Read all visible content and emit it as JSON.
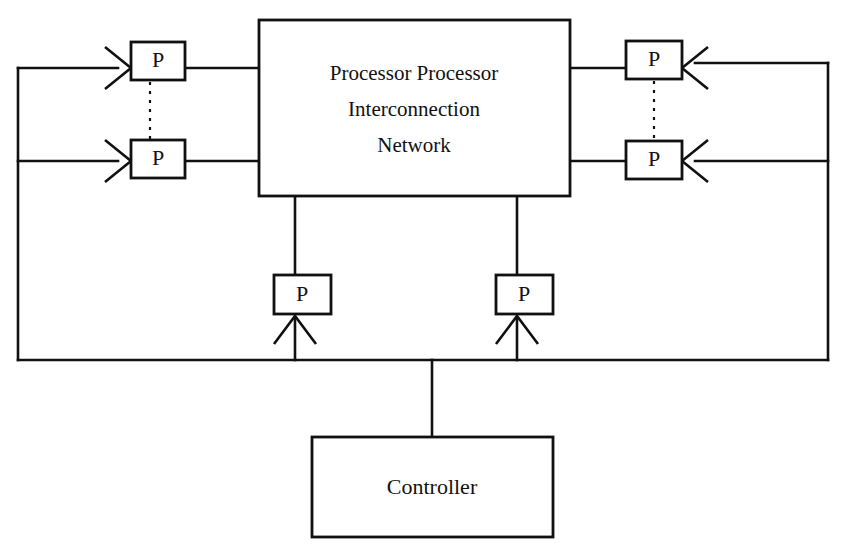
{
  "diagram": {
    "background_color": "#ffffff",
    "line_color": "#111111",
    "main_block": {
      "label_line1": "Processor Processor",
      "label_line2": "Interconnection",
      "label_line3": "Network"
    },
    "controller_block": {
      "label": "Controller"
    },
    "processors": [
      {
        "id": "p-left-top",
        "label": "P",
        "side": "left",
        "arrow": "right"
      },
      {
        "id": "p-left-bottom",
        "label": "P",
        "side": "left",
        "arrow": "right"
      },
      {
        "id": "p-right-top",
        "label": "P",
        "side": "right",
        "arrow": "left"
      },
      {
        "id": "p-right-bottom",
        "label": "P",
        "side": "right",
        "arrow": "left"
      },
      {
        "id": "p-bottom-left",
        "label": "P",
        "side": "bottom",
        "arrow": "up"
      },
      {
        "id": "p-bottom-right",
        "label": "P",
        "side": "bottom",
        "arrow": "up"
      }
    ],
    "connectors": {
      "vertical_dotted_left": "dotted",
      "vertical_dotted_right": "dotted",
      "left_bus": "solid",
      "right_bus": "solid",
      "bottom_bus": "solid",
      "controller_stem": "solid"
    }
  }
}
